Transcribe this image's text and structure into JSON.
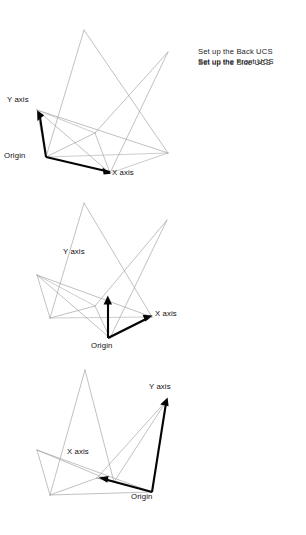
{
  "document": {
    "type": "technical-illustration",
    "subject": "AutoCAD UCS orientation diagrams",
    "background_color": "#ffffff",
    "wireframe_color": "#9a9a9a",
    "axis_color": "#050505",
    "text_color": "#1a1a1a"
  },
  "panels": [
    {
      "id": "front",
      "caption": "Set up the Front UCS",
      "labels": {
        "y_axis": "Y axis",
        "x_axis": "X axis",
        "origin": "Origin"
      }
    },
    {
      "id": "side",
      "caption": "Set up the Side UCS",
      "labels": {
        "y_axis": "Y axis",
        "x_axis": "X axis",
        "origin": "Origin"
      }
    },
    {
      "id": "back",
      "caption": "Set up the Back UCS",
      "labels": {
        "y_axis": "Y axis",
        "x_axis": "X axis",
        "origin": "Origin"
      }
    }
  ]
}
